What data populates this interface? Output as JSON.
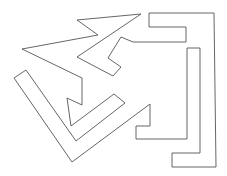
{
  "figure": {
    "stroke_color": "#555555",
    "background": "#ffffff",
    "stroke_width": 0.9,
    "polygon_points": "141,14 77,20 98,35 22,49 82,78 82,105 67,98 71,126 114,94 125,103 76,141 26,70 14,78 72,162 150,104 150,126 136,126 136,139 187,139 187,48 200,48 200,153 172,153 172,167 216,167 214,13 149,13 149,27 186,27 186,42 133,42 121,37 108,58 121,67 113,76 77,57"
  }
}
